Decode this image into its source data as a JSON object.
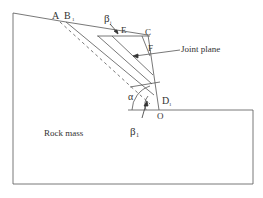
{
  "diagram": {
    "labels": {
      "A": "A",
      "B": "B",
      "B_sub": "1",
      "beta_j": "β",
      "beta_j_sub": "j",
      "E": "E",
      "C": "C",
      "F": "F",
      "joint_plane": "Joint plane",
      "alpha": "α",
      "D": "D",
      "D_sub": "1",
      "O": "O",
      "beta_1": "β",
      "beta_1_sub": "1",
      "rock_mass": "Rock mass"
    },
    "colors": {
      "line": "#555555",
      "text": "#333333",
      "background": "#ffffff"
    }
  }
}
